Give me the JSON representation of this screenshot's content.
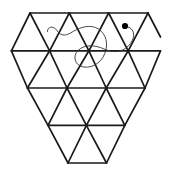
{
  "figure": {
    "width": 173,
    "height": 170,
    "background_color": "#ffffff",
    "lattice_line_color": "#1a1a1a",
    "lattice_line_width": 1.7,
    "annotation_curve_color": "#333333",
    "annotation_curve_width": 0.9,
    "dot_color": "#000000",
    "dot_radius": 3.1
  },
  "lattice": {
    "description": "Triangular lattice arranged as an inverted trapezoid narrowing to a downward point",
    "rows": [
      {
        "index": 0,
        "y": 13.0,
        "x_start": 30.0,
        "x_end": 148.0,
        "vertex_count": 4
      },
      {
        "index": 1,
        "y": 50.8,
        "x_start": 11.4,
        "x_end": 160.5,
        "vertex_count": 5
      },
      {
        "index": 2,
        "y": 88.0,
        "x_start": 27.5,
        "x_end": 145.0,
        "vertex_count": 4
      },
      {
        "index": 3,
        "y": 125.3,
        "x_start": 48.0,
        "x_end": 124.8,
        "vertex_count": 3
      },
      {
        "index": 4,
        "y": 163.0,
        "x_start": 68.0,
        "x_end": 106.5,
        "vertex_count": 2
      }
    ],
    "horizontal_edges": [
      {
        "name": "top-edge",
        "y": 13.0,
        "x1": 30.0,
        "x2": 148.0
      },
      {
        "name": "row1-edge",
        "y": 50.8,
        "x1": 11.4,
        "x2": 160.5
      },
      {
        "name": "row2-edge",
        "y": 88.0,
        "x1": 27.5,
        "x2": 145.0
      },
      {
        "name": "row3-edge",
        "y": 125.3,
        "x1": 48.0,
        "x2": 124.8
      },
      {
        "name": "bottom-edge",
        "y": 163.0,
        "x1": 68.0,
        "x2": 106.5
      }
    ],
    "diagonal_edges_down_right": [
      {
        "x1": 30.0,
        "y1": 13.0,
        "x2": 49.6,
        "y2": 50.8
      },
      {
        "x1": 69.3,
        "y1": 13.0,
        "x2": 88.9,
        "y2": 50.8
      },
      {
        "x1": 108.6,
        "y1": 13.0,
        "x2": 128.2,
        "y2": 50.8
      },
      {
        "x1": 148.0,
        "y1": 13.0,
        "x2": 160.5,
        "y2": 37.0
      },
      {
        "x1": 11.4,
        "y1": 50.8,
        "x2": 27.5,
        "y2": 88.0
      },
      {
        "x1": 49.6,
        "y1": 50.8,
        "x2": 67.0,
        "y2": 88.0
      },
      {
        "x1": 88.9,
        "y1": 50.8,
        "x2": 106.2,
        "y2": 88.0
      },
      {
        "x1": 128.2,
        "y1": 50.8,
        "x2": 145.0,
        "y2": 88.0
      },
      {
        "x1": 27.5,
        "y1": 88.0,
        "x2": 48.0,
        "y2": 125.3
      },
      {
        "x1": 67.0,
        "y1": 88.0,
        "x2": 86.4,
        "y2": 125.3
      },
      {
        "x1": 106.2,
        "y1": 88.0,
        "x2": 124.8,
        "y2": 125.3
      },
      {
        "x1": 48.0,
        "y1": 125.3,
        "x2": 68.0,
        "y2": 163.0
      },
      {
        "x1": 86.4,
        "y1": 125.3,
        "x2": 106.5,
        "y2": 163.0
      }
    ],
    "diagonal_edges_down_left": [
      {
        "x1": 30.0,
        "y1": 13.0,
        "x2": 11.4,
        "y2": 50.8
      },
      {
        "x1": 69.3,
        "y1": 13.0,
        "x2": 49.6,
        "y2": 50.8
      },
      {
        "x1": 108.6,
        "y1": 13.0,
        "x2": 88.9,
        "y2": 50.8
      },
      {
        "x1": 148.0,
        "y1": 13.0,
        "x2": 128.2,
        "y2": 50.8
      },
      {
        "x1": 49.6,
        "y1": 50.8,
        "x2": 27.5,
        "y2": 88.0
      },
      {
        "x1": 88.9,
        "y1": 50.8,
        "x2": 67.0,
        "y2": 88.0
      },
      {
        "x1": 128.2,
        "y1": 50.8,
        "x2": 106.2,
        "y2": 88.0
      },
      {
        "x1": 160.5,
        "y1": 50.8,
        "x2": 145.0,
        "y2": 88.0
      },
      {
        "x1": 67.0,
        "y1": 88.0,
        "x2": 48.0,
        "y2": 125.3
      },
      {
        "x1": 106.2,
        "y1": 88.0,
        "x2": 86.4,
        "y2": 125.3
      },
      {
        "x1": 145.0,
        "y1": 88.0,
        "x2": 124.8,
        "y2": 125.3
      },
      {
        "x1": 86.4,
        "y1": 125.3,
        "x2": 68.0,
        "y2": 163.0
      },
      {
        "x1": 124.8,
        "y1": 125.3,
        "x2": 106.5,
        "y2": 163.0
      }
    ]
  },
  "annotations": {
    "curve": {
      "name": "hand-drawn-squiggle",
      "path": "M 47.5 31.5 C 47.0 26.5, 53.5 25.5, 56.5 30.0 C 60.0 35.5, 64.5 36.5, 70.5 33.0 C 78.5 28.0, 87.5 24.5, 95.5 27.5 C 104.5 31.0, 108.0 40.5, 106.0 49.5 C 103.5 61.0, 94.0 68.5, 83.5 67.0 C 74.5 65.5, 72.5 56.0, 78.0 50.5 C 84.5 44.0, 95.5 45.0, 104.0 49.0 C 115.0 54.0, 124.5 51.5, 130.5 43.5 C 136.0 36.0, 134.0 28.5, 128.0 27.0"
    },
    "dot": {
      "name": "marker-dot",
      "cx": 125.0,
      "cy": 26.0
    }
  }
}
